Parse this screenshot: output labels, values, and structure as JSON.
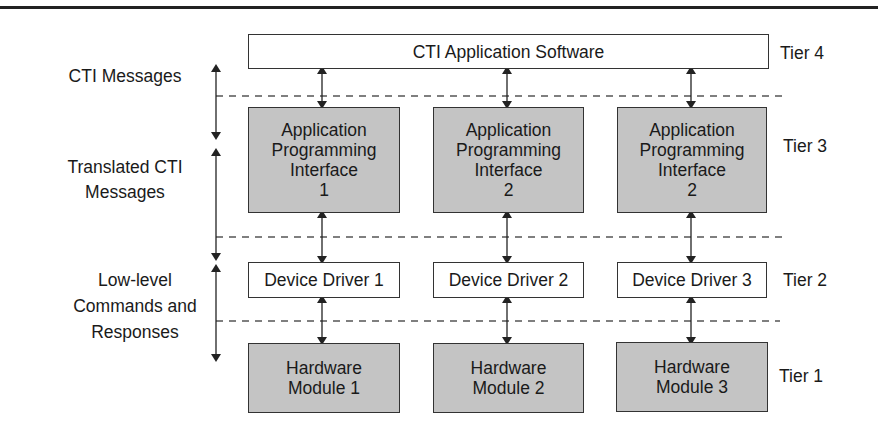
{
  "diagram": {
    "title_box": {
      "label": "CTI Application Software"
    },
    "tiers": [
      {
        "label": "Tier 4"
      },
      {
        "label": "Tier 3"
      },
      {
        "label": "Tier 2"
      },
      {
        "label": "Tier 1"
      }
    ],
    "left_labels": [
      {
        "lines": [
          "CTI Messages"
        ]
      },
      {
        "lines": [
          "Translated CTI",
          "Messages"
        ]
      },
      {
        "lines": [
          "Low-level",
          "Commands and",
          "Responses"
        ]
      }
    ],
    "api_boxes": [
      {
        "lines": [
          "Application",
          "Programming",
          "Interface",
          "1"
        ]
      },
      {
        "lines": [
          "Application",
          "Programming",
          "Interface",
          "2"
        ]
      },
      {
        "lines": [
          "Application",
          "Programming",
          "Interface",
          "2"
        ]
      }
    ],
    "driver_boxes": [
      {
        "label": "Device Driver 1"
      },
      {
        "label": "Device Driver 2"
      },
      {
        "label": "Device Driver 3"
      }
    ],
    "hardware_boxes": [
      {
        "lines": [
          "Hardware",
          "Module 1"
        ]
      },
      {
        "lines": [
          "Hardware",
          "Module 2"
        ]
      },
      {
        "lines": [
          "Hardware",
          "Module 3"
        ]
      }
    ],
    "colors": {
      "gray_fill": "#c4c4c4",
      "white_fill": "#ffffff",
      "line": "#333333"
    }
  }
}
